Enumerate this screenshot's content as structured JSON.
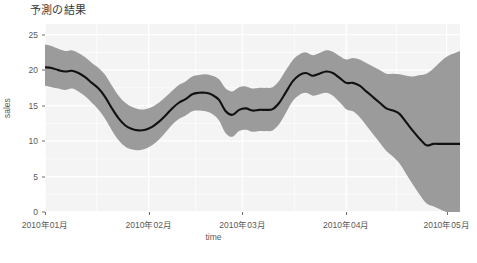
{
  "chart_data": {
    "type": "line",
    "title": "予測の結果",
    "xlabel": "time",
    "ylabel": "sales",
    "ylim": [
      0,
      26.5
    ],
    "xlim": [
      "2010-01-01",
      "2010-05-05"
    ],
    "grid": true,
    "legend": null,
    "y_ticks": [
      {
        "value": 0,
        "label": "0"
      },
      {
        "value": 5,
        "label": "5"
      },
      {
        "value": 10,
        "label": "10"
      },
      {
        "value": 15,
        "label": "15"
      },
      {
        "value": 20,
        "label": "20"
      },
      {
        "value": 25,
        "label": "25"
      }
    ],
    "x_ticks": [
      {
        "value": 0,
        "label": "2010年01月"
      },
      {
        "value": 31,
        "label": "2010年02月"
      },
      {
        "value": 59,
        "label": "2010年03月"
      },
      {
        "value": 90,
        "label": "2010年04月"
      },
      {
        "value": 120,
        "label": "2010年05月"
      }
    ],
    "series": [
      {
        "name": "fit_forecast",
        "kind": "line",
        "color": "#111111",
        "x": [
          0,
          2,
          4,
          6,
          8,
          10,
          12,
          14,
          16,
          18,
          20,
          22,
          24,
          26,
          28,
          30,
          32,
          34,
          36,
          38,
          40,
          42,
          44,
          46,
          48,
          50,
          52,
          54,
          56,
          58,
          60,
          62,
          64,
          66,
          68,
          70,
          72,
          74,
          76,
          78,
          80,
          82,
          84,
          86,
          88,
          90,
          92,
          94,
          96,
          98,
          100,
          102,
          104,
          106,
          108,
          110,
          112,
          114,
          116,
          118,
          120,
          124
        ],
        "y": [
          20.4,
          20.3,
          20.0,
          19.8,
          19.9,
          19.6,
          19.0,
          18.2,
          17.4,
          16.2,
          14.6,
          13.2,
          12.2,
          11.7,
          11.5,
          11.6,
          12.0,
          12.7,
          13.6,
          14.6,
          15.4,
          15.9,
          16.6,
          16.8,
          16.8,
          16.5,
          15.8,
          14.2,
          13.7,
          14.4,
          14.6,
          14.3,
          14.4,
          14.4,
          14.5,
          15.4,
          16.9,
          18.4,
          19.3,
          19.6,
          19.2,
          19.5,
          19.8,
          19.6,
          18.9,
          18.2,
          18.2,
          17.8,
          17.0,
          16.2,
          15.4,
          14.6,
          14.3,
          13.8,
          12.6,
          11.4,
          10.3,
          9.4,
          9.6,
          9.6,
          9.6,
          9.6
        ]
      },
      {
        "name": "uncertainty_interval",
        "kind": "ribbon",
        "color": "#9b9b9b",
        "x": [
          0,
          2,
          4,
          6,
          8,
          10,
          12,
          14,
          16,
          18,
          20,
          22,
          24,
          26,
          28,
          30,
          32,
          34,
          36,
          38,
          40,
          42,
          44,
          46,
          48,
          50,
          52,
          54,
          56,
          58,
          60,
          62,
          64,
          66,
          68,
          70,
          72,
          74,
          76,
          78,
          80,
          82,
          84,
          86,
          88,
          90,
          92,
          94,
          96,
          98,
          100,
          102,
          104,
          106,
          108,
          110,
          112,
          114,
          116,
          118,
          120,
          124
        ],
        "ymin": [
          17.8,
          17.6,
          17.4,
          17.2,
          17.4,
          17.0,
          16.3,
          15.4,
          14.4,
          13.1,
          11.5,
          10.1,
          9.2,
          8.8,
          8.7,
          8.9,
          9.4,
          10.2,
          11.2,
          12.3,
          13.1,
          13.6,
          14.2,
          14.3,
          14.2,
          13.8,
          12.9,
          11.1,
          10.6,
          11.4,
          11.6,
          11.3,
          11.4,
          11.4,
          11.5,
          12.4,
          14.0,
          15.6,
          16.5,
          16.8,
          16.4,
          16.6,
          16.8,
          16.4,
          15.5,
          14.5,
          14.2,
          13.4,
          12.2,
          11.0,
          9.8,
          8.6,
          7.8,
          6.8,
          5.3,
          3.8,
          2.4,
          1.2,
          0.8,
          0.4,
          0.0,
          -0.5
        ],
        "ymax": [
          23.6,
          23.4,
          23.0,
          22.7,
          22.8,
          22.4,
          21.8,
          21.0,
          20.3,
          19.3,
          17.8,
          16.4,
          15.4,
          14.8,
          14.5,
          14.5,
          14.8,
          15.4,
          16.2,
          17.1,
          17.9,
          18.4,
          19.1,
          19.3,
          19.4,
          19.2,
          18.7,
          17.4,
          17.0,
          17.6,
          17.7,
          17.4,
          17.5,
          17.5,
          17.6,
          18.5,
          20.0,
          21.4,
          22.2,
          22.5,
          22.1,
          22.4,
          22.8,
          22.6,
          22.0,
          21.5,
          21.7,
          21.5,
          21.0,
          20.5,
          20.0,
          19.5,
          19.5,
          19.4,
          19.2,
          19.1,
          19.3,
          19.5,
          20.2,
          21.1,
          21.9,
          22.7
        ]
      }
    ],
    "panel_background": "#f4f4f4",
    "gridline_color": "#ffffff",
    "line_color": "#111111",
    "ribbon_color": "#9b9b9b"
  }
}
